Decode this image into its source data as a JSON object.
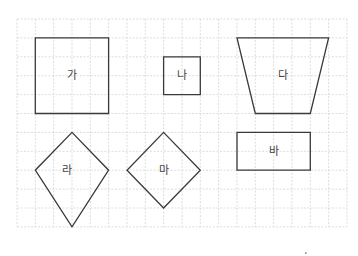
{
  "diagram": {
    "grid": {
      "origin_x": 17,
      "origin_y": 19,
      "cell_w": 18.33,
      "cell_h": 18.9,
      "cols": 18,
      "rows": 11,
      "line_color": "#d4d4d4"
    },
    "stroke_color": "#3a3a3a",
    "shapes": [
      {
        "id": "ga",
        "label": "가",
        "type": "square",
        "points": [
          [
            1,
            1
          ],
          [
            5,
            1
          ],
          [
            5,
            5
          ],
          [
            1,
            5
          ]
        ],
        "label_pos": [
          3,
          3
        ]
      },
      {
        "id": "na",
        "label": "나",
        "type": "square",
        "points": [
          [
            8,
            2
          ],
          [
            10,
            2
          ],
          [
            10,
            4
          ],
          [
            8,
            4
          ]
        ],
        "label_pos": [
          9,
          3
        ]
      },
      {
        "id": "da",
        "label": "다",
        "type": "trapezoid",
        "points": [
          [
            12,
            1
          ],
          [
            17,
            1
          ],
          [
            16,
            5
          ],
          [
            13,
            5
          ]
        ],
        "label_pos": [
          14.5,
          3
        ]
      },
      {
        "id": "ra",
        "label": "라",
        "type": "kite",
        "points": [
          [
            3,
            6
          ],
          [
            5,
            8
          ],
          [
            3,
            11
          ],
          [
            1,
            8
          ]
        ],
        "label_pos": [
          2.75,
          8
        ]
      },
      {
        "id": "ma",
        "label": "마",
        "type": "rhombus",
        "points": [
          [
            8,
            6
          ],
          [
            10,
            8
          ],
          [
            8,
            10
          ],
          [
            6,
            8
          ]
        ],
        "label_pos": [
          8,
          8
        ]
      },
      {
        "id": "ba",
        "label": "바",
        "type": "rectangle",
        "points": [
          [
            12,
            6
          ],
          [
            16,
            6
          ],
          [
            16,
            8
          ],
          [
            12,
            8
          ]
        ],
        "label_pos": [
          14,
          7
        ]
      }
    ]
  }
}
